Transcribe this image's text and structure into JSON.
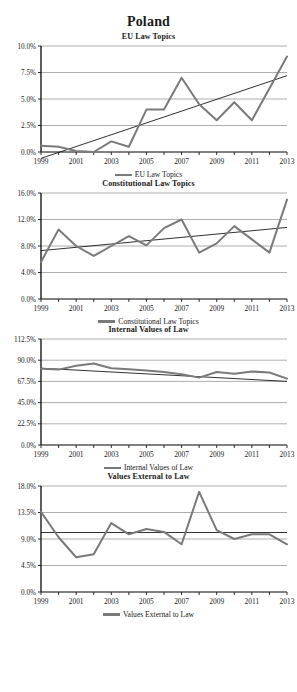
{
  "page": {
    "title": "Poland"
  },
  "axis": {
    "x_ticks": [
      "1999",
      "2001",
      "2003",
      "2005",
      "2007",
      "2009",
      "2011",
      "2013"
    ],
    "x_all_years": [
      1999,
      2000,
      2001,
      2002,
      2003,
      2004,
      2005,
      2006,
      2007,
      2008,
      2009,
      2010,
      2011,
      2012,
      2013
    ]
  },
  "colors": {
    "series_line": "#7a7a7a",
    "trend_line": "#1a1a1a",
    "gridline": "#9a9a9a",
    "axis": "#1a1a1a",
    "text": "#1a1a1a",
    "background": "#ffffff"
  },
  "chart_data": [
    {
      "type": "line",
      "title": "EU Law Topics",
      "xlabel": "",
      "ylabel": "",
      "ylim": [
        0,
        10
      ],
      "y_ticks": [
        0,
        2.5,
        5,
        7.5,
        10
      ],
      "y_tick_labels": [
        "0.0%",
        "2.5%",
        "5.0%",
        "7.5%",
        "10.0%"
      ],
      "x": [
        1999,
        2000,
        2001,
        2002,
        2003,
        2004,
        2005,
        2006,
        2007,
        2008,
        2009,
        2010,
        2011,
        2012,
        2013
      ],
      "x_tick_labels": [
        "1999",
        "2001",
        "2003",
        "2005",
        "2007",
        "2009",
        "2011",
        "2013"
      ],
      "grid": true,
      "legend_position": "bottom",
      "series": [
        {
          "name": "EU Law Topics",
          "values": [
            0.6,
            0.5,
            0.1,
            0.0,
            1.0,
            0.5,
            4.0,
            4.0,
            7.0,
            4.5,
            3.0,
            4.7,
            3.0,
            6.0,
            9.0
          ]
        }
      ],
      "trendline": {
        "name": "Linear trend",
        "start_value": -0.6,
        "end_value": 7.2
      }
    },
    {
      "type": "line",
      "title": "Constitutional Law Topics",
      "xlabel": "",
      "ylabel": "",
      "ylim": [
        0,
        16
      ],
      "y_ticks": [
        0,
        4,
        8,
        12,
        16
      ],
      "y_tick_labels": [
        "0.0%",
        "4.0%",
        "8.0%",
        "12.0%",
        "16.0%"
      ],
      "x": [
        1999,
        2000,
        2001,
        2002,
        2003,
        2004,
        2005,
        2006,
        2007,
        2008,
        2009,
        2010,
        2011,
        2012,
        2013
      ],
      "x_tick_labels": [
        "1999",
        "2001",
        "2003",
        "2005",
        "2007",
        "2009",
        "2011",
        "2013"
      ],
      "grid": true,
      "legend_position": "bottom",
      "series": [
        {
          "name": "Constitutional Law Topics",
          "values": [
            5.6,
            10.5,
            8.0,
            6.5,
            8.0,
            9.5,
            8.1,
            10.7,
            12.0,
            7.0,
            8.4,
            11.0,
            9.0,
            7.0,
            15.0
          ]
        }
      ],
      "trendline": {
        "name": "Linear trend",
        "start_value": 7.3,
        "end_value": 10.8
      }
    },
    {
      "type": "line",
      "title": "Internal Values of Law",
      "xlabel": "",
      "ylabel": "",
      "ylim": [
        0,
        112.5
      ],
      "y_ticks": [
        0,
        22.5,
        45,
        67.5,
        90,
        112.5
      ],
      "y_tick_labels": [
        "0.0%",
        "22.5%",
        "45.0%",
        "67.5%",
        "90.0%",
        "112.5%"
      ],
      "x": [
        1999,
        2000,
        2001,
        2002,
        2003,
        2004,
        2005,
        2006,
        2007,
        2008,
        2009,
        2010,
        2011,
        2012,
        2013
      ],
      "x_tick_labels": [
        "1999",
        "2001",
        "2003",
        "2005",
        "2007",
        "2009",
        "2011",
        "2013"
      ],
      "grid": true,
      "legend_position": "bottom",
      "series": [
        {
          "name": "Internal Values of Law",
          "values": [
            81.0,
            80.0,
            84.0,
            86.5,
            81.5,
            80.5,
            79.0,
            77.5,
            75.0,
            71.5,
            77.5,
            75.5,
            78.0,
            77.0,
            70.5
          ]
        }
      ],
      "trendline": {
        "name": "Linear trend",
        "start_value": 81.5,
        "end_value": 67.5
      }
    },
    {
      "type": "line",
      "title": "Values External to Law",
      "xlabel": "",
      "ylabel": "",
      "ylim": [
        0,
        18
      ],
      "y_ticks": [
        0,
        4.5,
        9,
        13.5,
        18
      ],
      "y_tick_labels": [
        "0.0%",
        "4.5%",
        "9.0%",
        "13.5%",
        "18.0%"
      ],
      "x": [
        1999,
        2000,
        2001,
        2002,
        2003,
        2004,
        2005,
        2006,
        2007,
        2008,
        2009,
        2010,
        2011,
        2012,
        2013
      ],
      "x_tick_labels": [
        "1999",
        "2001",
        "2003",
        "2005",
        "2007",
        "2009",
        "2011",
        "2013"
      ],
      "grid": true,
      "legend_position": "bottom",
      "series": [
        {
          "name": "Values External to Law",
          "values": [
            13.6,
            9.3,
            5.9,
            6.4,
            11.7,
            9.8,
            10.7,
            10.2,
            8.1,
            17.0,
            10.5,
            9.0,
            9.8,
            9.8,
            8.1
          ]
        }
      ],
      "trendline": {
        "name": "Linear trend",
        "start_value": 10.1,
        "end_value": 10.1
      }
    }
  ],
  "panels": [
    {
      "title": "EU Law Topics",
      "legend_label": "EU Law Topics"
    },
    {
      "title": "Constitutional Law Topics",
      "legend_label": "Constitutional Law Topics"
    },
    {
      "title": "Internal Values of Law",
      "legend_label": "Internal Values of Law"
    },
    {
      "title": "Values External to Law",
      "legend_label": "Values External to Law"
    }
  ]
}
